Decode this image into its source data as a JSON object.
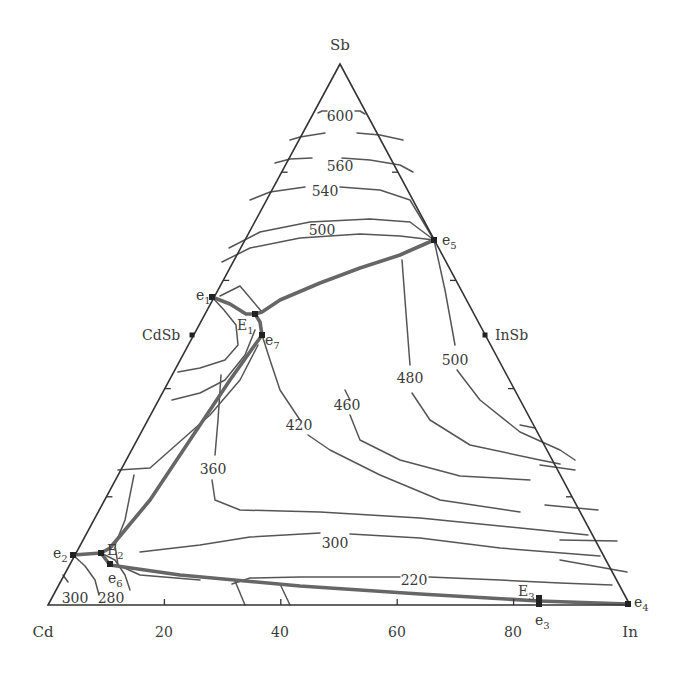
{
  "diagram": {
    "type": "ternary-liquidus-projection",
    "system": [
      "Cd",
      "In",
      "Sb"
    ],
    "colors": {
      "axis": "#333333",
      "isotherm": "#555555",
      "boundary": "#666666",
      "text": "#3a3a3a"
    },
    "vertices": {
      "top": {
        "label": "Sb",
        "x": 340,
        "y": 64
      },
      "left": {
        "label": "Cd",
        "x": 48,
        "y": 605
      },
      "right": {
        "label": "In",
        "x": 630,
        "y": 605
      }
    },
    "bottom_axis": {
      "ticks": [
        {
          "label": "20",
          "x": 164
        },
        {
          "label": "40",
          "x": 280
        },
        {
          "label": "60",
          "x": 397
        },
        {
          "label": "80",
          "x": 513
        }
      ]
    },
    "compounds": [
      {
        "label": "CdSb",
        "x": 192,
        "y": 335,
        "label_x": 142,
        "label_y": 340
      },
      {
        "label": "InSb",
        "x": 485,
        "y": 335,
        "label_x": 495,
        "label_y": 340
      }
    ],
    "invariant_points": [
      {
        "main": "e",
        "sub": "1",
        "x": 212,
        "y": 297,
        "lx": 196,
        "ly": 300
      },
      {
        "main": "e",
        "sub": "2",
        "x": 73,
        "y": 555,
        "lx": 53,
        "ly": 558
      },
      {
        "main": "e",
        "sub": "3",
        "x": 539,
        "y": 604,
        "lx": 535,
        "ly": 625
      },
      {
        "main": "e",
        "sub": "4",
        "x": 628,
        "y": 604,
        "lx": 634,
        "ly": 607
      },
      {
        "main": "e",
        "sub": "5",
        "x": 434,
        "y": 240,
        "lx": 442,
        "ly": 245
      },
      {
        "main": "e",
        "sub": "6",
        "x": 110,
        "y": 564,
        "lx": 108,
        "ly": 583
      },
      {
        "main": "e",
        "sub": "7",
        "x": 262,
        "y": 335,
        "lx": 265,
        "ly": 345
      },
      {
        "main": "E",
        "sub": "1",
        "x": 255,
        "y": 314,
        "lx": 237,
        "ly": 330
      },
      {
        "main": "E",
        "sub": "2",
        "x": 101,
        "y": 553,
        "lx": 107,
        "ly": 555
      },
      {
        "main": "E",
        "sub": "3",
        "x": 539,
        "y": 598,
        "lx": 518,
        "ly": 596
      }
    ],
    "isotherm_labels": [
      {
        "text": "600",
        "x": 340,
        "y": 116
      },
      {
        "text": "560",
        "x": 340,
        "y": 166
      },
      {
        "text": "540",
        "x": 325,
        "y": 191
      },
      {
        "text": "500",
        "x": 322,
        "y": 230
      },
      {
        "text": "500",
        "x": 455,
        "y": 360
      },
      {
        "text": "480",
        "x": 410,
        "y": 378
      },
      {
        "text": "460",
        "x": 347,
        "y": 405
      },
      {
        "text": "420",
        "x": 299,
        "y": 425
      },
      {
        "text": "360",
        "x": 213,
        "y": 469
      },
      {
        "text": "300",
        "x": 335,
        "y": 543
      },
      {
        "text": "220",
        "x": 414,
        "y": 580
      },
      {
        "text": "300",
        "x": 75,
        "y": 598
      },
      {
        "text": "280",
        "x": 111,
        "y": 598
      }
    ],
    "univariant_lines": [
      {
        "from": "e1",
        "to": "E1",
        "points": "212,297 230,304 246,314 255,314"
      },
      {
        "from": "e5",
        "to": "E1",
        "points": "434,240 400,255 360,268 320,283 280,300 262,312 255,314"
      },
      {
        "from": "E1",
        "to": "e7",
        "points": "255,314 260,322 262,335"
      },
      {
        "from": "e7",
        "to": "E2",
        "points": "262,335 230,380 190,440 150,500 110,548 101,553"
      },
      {
        "from": "e2",
        "to": "E2",
        "points": "73,555 101,553"
      },
      {
        "from": "E2",
        "to": "E3",
        "points": "101,553 110,565 180,575 300,586 420,594 539,601"
      },
      {
        "from": "E3",
        "to": "e4",
        "points": "539,601 628,604"
      }
    ],
    "isotherms": [
      {
        "t": "600",
        "points": "318,113 322,111 327,111",
        "points2": "355,111 360,111 365,114"
      },
      {
        "t": "560",
        "points": "290,140 300,137 325,133",
        "points2": "357,133 380,135 403,140"
      },
      {
        "t": "540",
        "points": "275,163 290,159 312,158",
        "points2": "342,158 370,160 400,165 413,172"
      },
      {
        "t": "500",
        "points": "250,200 270,192 305,187",
        "points2": "340,187 380,190 410,200 434,240"
      },
      {
        "t": "480-upper",
        "points": "229,248 260,232 310,222 370,219 410,222 434,240"
      },
      {
        "t": "460-upper",
        "points": "222,262 250,248 300,238 360,234 400,236 434,240"
      },
      {
        "t": "cdsb-inner-1",
        "points": "220,296 240,286 262,312"
      },
      {
        "t": "cdsb-inner-2",
        "points": "212,297 224,310 236,325 238,345 225,360 200,368 178,372"
      },
      {
        "t": "cdsb-inner-3",
        "points": "255,330 245,355 225,380 200,393 172,400"
      },
      {
        "t": "cdsb-inner-4",
        "points": "258,345 240,380 210,415 150,468 118,470"
      },
      {
        "t": "e7-down",
        "points": "262,335 270,360 280,390 300,420"
      },
      {
        "t": "420",
        "points": "308,435 330,450 380,475 440,500 520,512"
      },
      {
        "t": "460",
        "points": "345,390 350,400",
        "points2": "350,415 360,440 400,460 460,476 530,480"
      },
      {
        "t": "480",
        "points": "402,260 405,300 410,365",
        "points2": "412,393 430,420 470,445 540,460 560,464"
      },
      {
        "t": "500-right",
        "points": "434,240 445,290 455,345",
        "points2": "457,370 480,400 520,432 560,450 575,460"
      },
      {
        "t": "360",
        "points": "221,375 218,420 215,455",
        "points2": "212,480 215,500 240,510 320,512 420,518 540,530 588,535"
      },
      {
        "t": "300",
        "points": "140,552 200,545 250,537 320,533",
        "points2": "350,534 420,538 500,548 600,556"
      },
      {
        "t": "220",
        "points": "232,584 250,578 300,577 400,577",
        "points2": "429,577 500,580 560,583 612,585"
      },
      {
        "t": "left-low-1",
        "points": "134,475 125,520 115,545 118,565 140,575 200,580"
      },
      {
        "t": "280",
        "points": "101,553 115,560 125,575 130,590"
      },
      {
        "t": "e2-300",
        "points": "73,555 85,566 95,580 99,595"
      },
      {
        "t": "300-left",
        "points": "63,575 68,582"
      },
      {
        "t": "ternary-dropA",
        "points": "235,581 245,605"
      },
      {
        "t": "ternary-dropB",
        "points": "280,584 290,605"
      },
      {
        "t": "right-edge-1",
        "points": "520,425 535,428"
      },
      {
        "t": "right-edge-2",
        "points": "540,465 575,470"
      },
      {
        "t": "right-edge-3",
        "points": "545,505 598,510"
      },
      {
        "t": "right-edge-4",
        "points": "560,540 617,541"
      },
      {
        "t": "right-edge-5",
        "points": "560,560 627,572"
      }
    ]
  }
}
